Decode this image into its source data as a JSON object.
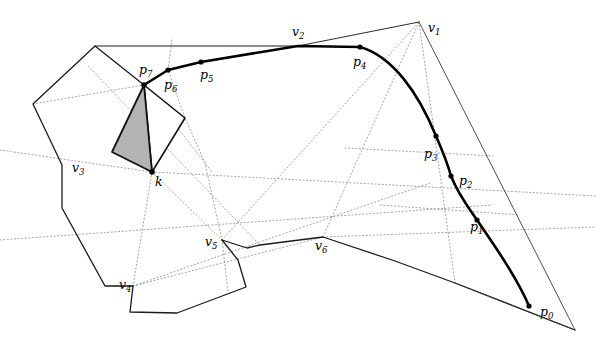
{
  "figure": {
    "width": 608,
    "height": 353,
    "background": "#ffffff"
  },
  "styles": {
    "solid_stroke": "#1a1a1a",
    "thin_stroke": "#3a3a3a",
    "dotted_stroke": "#9a9a9a",
    "thick_curve_stroke": "#000000",
    "shaded_fill": "#b3b3b3",
    "point_fill": "#000000"
  },
  "labels": [
    {
      "id": "v1",
      "base": "v",
      "sub": "1",
      "x": 428,
      "y": 32
    },
    {
      "id": "v2",
      "base": "v",
      "sub": "2",
      "x": 292,
      "y": 36
    },
    {
      "id": "v3",
      "base": "v",
      "sub": "3",
      "x": 72,
      "y": 172
    },
    {
      "id": "v4",
      "base": "v",
      "sub": "4",
      "x": 119,
      "y": 289
    },
    {
      "id": "v5",
      "base": "v",
      "sub": "5",
      "x": 205,
      "y": 246
    },
    {
      "id": "v6",
      "base": "v",
      "sub": "6",
      "x": 315,
      "y": 250
    },
    {
      "id": "p0",
      "base": "p",
      "sub": "0",
      "x": 540,
      "y": 316
    },
    {
      "id": "p1",
      "base": "p",
      "sub": "1",
      "x": 470,
      "y": 231
    },
    {
      "id": "p2",
      "base": "p",
      "sub": "2",
      "x": 459,
      "y": 185
    },
    {
      "id": "p3",
      "base": "p",
      "sub": "3",
      "x": 424,
      "y": 158
    },
    {
      "id": "p4",
      "base": "p",
      "sub": "4",
      "x": 353,
      "y": 66
    },
    {
      "id": "p5",
      "base": "p",
      "sub": "5",
      "x": 200,
      "y": 79
    },
    {
      "id": "p6",
      "base": "p",
      "sub": "6",
      "x": 164,
      "y": 89
    },
    {
      "id": "p7",
      "base": "p",
      "sub": "7",
      "x": 139,
      "y": 74
    },
    {
      "id": "k",
      "base": "k",
      "sub": "",
      "x": 155,
      "y": 186
    }
  ],
  "points": [
    {
      "id": "p0",
      "x": 529,
      "y": 306,
      "r": 2.6
    },
    {
      "id": "p1",
      "x": 477,
      "y": 220,
      "r": 2.6
    },
    {
      "id": "p2",
      "x": 451,
      "y": 176,
      "r": 2.6
    },
    {
      "id": "p3",
      "x": 436,
      "y": 136,
      "r": 2.6
    },
    {
      "id": "p4",
      "x": 360,
      "y": 47,
      "r": 2.6
    },
    {
      "id": "p5",
      "x": 201,
      "y": 62,
      "r": 2.6
    },
    {
      "id": "p6",
      "x": 168,
      "y": 70,
      "r": 2.6
    },
    {
      "id": "p7",
      "x": 144,
      "y": 85,
      "r": 2.8
    },
    {
      "id": "k",
      "x": 152,
      "y": 172,
      "r": 2.8
    }
  ],
  "paths": {
    "thick_curve": "M 144 85 L 168 70 L 201 62 L 298 46 L 360 47 C 392 56 418 92 436 136 C 443 152 448 165 451 176 C 459 196 469 208 477 220 C 497 249 518 280 529 306",
    "outer_polygon_left": "M 144 85 L 95 46 L 33 104 L 62 165 L 62 208 L 105 286 L 133 286",
    "polygon_v4_chain": "M 133 286 L 130 312 L 177 313 L 246 287 L 238 260 L 222 240",
    "polygon_v5_chain": "M 222 240 L 247 248 L 260 245 L 323 237 L 395 261 L 455 283 L 575 330",
    "polygon_top_chain": "M 95 46 L 298 46",
    "thin_v2_v1": "M 298 46 L 419 22",
    "thin_v1_bottom": "M 419 22 L 575 330",
    "thin_tail": "M 575 330 L 455 283",
    "triangle_shaded": "M 144 85 L 112 152 L 152 172 Z",
    "triangle_thin": "M 144 85 L 185 118 L 152 172 Z"
  },
  "dotted_paths": [
    "M 33 104 L 144 85",
    "M 144 85 L 212 172",
    "M 172 40 L 168 70 L 185 118 L 205 163 L 222 240 L 228 292",
    "M 152 172 L 133 286",
    "M 152 172 L 222 240",
    "M 152 172 L 596 196",
    "M 133 286 L 323 237",
    "M 133 286 L 430 183",
    "M 88 66 L 260 245",
    "M 222 240 L 419 22",
    "M 323 237 L 419 22",
    "M 419 22 L 455 283",
    "M 0 240 L 492 205",
    "M 0 150 L 152 172",
    "M 345 148 L 493 156",
    "M 380 205 L 520 215",
    "M 323 237 L 596 227"
  ],
  "description": {
    "shaded_region": "gray triangle p7-k",
    "curve_label": "thick geodesic path p0..p7"
  }
}
